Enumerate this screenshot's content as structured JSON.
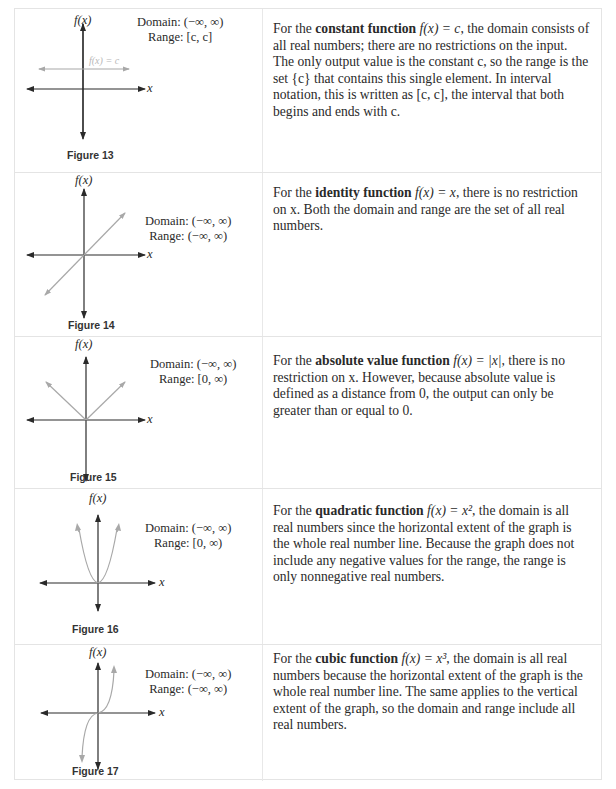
{
  "rows": [
    {
      "figure": "Figure 13",
      "fx_label": "f(x)",
      "x_label": "x",
      "curve_label": "f(x) = c",
      "domain": "Domain: (−∞, ∞)",
      "range": "Range: [c, c]",
      "desc_pre": "For the ",
      "desc_bold": "constant function",
      "desc_formula": " f(x) = c",
      "desc_post": ", the domain consists of all real numbers; there are no restrictions on the input. The only output value is the constant c, so the range is the set {c} that contains this single element. In interval notation, this is written as [c, c], the interval that both begins and ends with c."
    },
    {
      "figure": "Figure 14",
      "fx_label": "f(x)",
      "x_label": "x",
      "domain": "Domain: (−∞, ∞)",
      "range": "Range: (−∞, ∞)",
      "desc_pre": "For the ",
      "desc_bold": "identity function",
      "desc_formula": " f(x) = x",
      "desc_post": ", there is no restriction on x. Both the domain and range are the set of all real numbers."
    },
    {
      "figure": "Figure 15",
      "fx_label": "f(x)",
      "x_label": "x",
      "domain": "Domain: (−∞, ∞)",
      "range": "Range: [0, ∞)",
      "desc_pre": "For the ",
      "desc_bold": "absolute value function",
      "desc_formula": " f(x) = |x|",
      "desc_post": ", there is no restriction on x. However, because absolute value is defined as a distance from 0, the output can only be greater than or equal to 0."
    },
    {
      "figure": "Figure 16",
      "fx_label": "f(x)",
      "x_label": "x",
      "domain": "Domain: (−∞, ∞)",
      "range": "Range: [0, ∞)",
      "desc_pre": "For the ",
      "desc_bold": "quadratic function",
      "desc_formula": " f(x) = x²",
      "desc_post": ", the domain is all real numbers since the horizontal extent of the graph is the whole real number line. Because the graph does not include any negative values for the range, the range is only nonnegative real numbers."
    },
    {
      "figure": "Figure 17",
      "fx_label": "f(x)",
      "x_label": "x",
      "domain": "Domain: (−∞, ∞)",
      "range": "Range: (−∞, ∞)",
      "desc_pre": "For the ",
      "desc_bold": "cubic function",
      "desc_formula": " f(x) = x³",
      "desc_post": ", the domain is all real numbers because the horizontal extent of the graph is the whole real number line. The same applies to the vertical extent of the graph, so the domain and range include all real numbers."
    }
  ],
  "colors": {
    "axis": "#2a2a2a",
    "curve": "#a8a8a8",
    "border": "#e4e4e4"
  }
}
